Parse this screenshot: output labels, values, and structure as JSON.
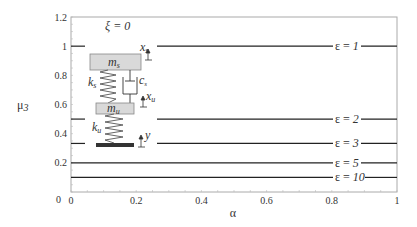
{
  "chart_data": {
    "type": "line",
    "title": "",
    "annotation": "ξ = 0",
    "xlabel": "α",
    "ylabel": "μ3",
    "xlim": [
      0,
      1
    ],
    "ylim": [
      0,
      1.2
    ],
    "x_ticks": [
      "0",
      "0.2",
      "0.4",
      "0.6",
      "0.8",
      "1"
    ],
    "y_ticks": [
      "0",
      "0.2",
      "0.4",
      "0.6",
      "0.8",
      "1",
      "1.2"
    ],
    "grid": false,
    "series": [
      {
        "name": "ε = 1",
        "x": [
          0,
          1
        ],
        "values": [
          1.0,
          1.0
        ]
      },
      {
        "name": "ε = 2",
        "x": [
          0,
          1
        ],
        "values": [
          0.5,
          0.5
        ]
      },
      {
        "name": "ε = 3",
        "x": [
          0,
          1
        ],
        "values": [
          0.333,
          0.333
        ]
      },
      {
        "name": "ε = 5",
        "x": [
          0,
          1
        ],
        "values": [
          0.2,
          0.2
        ]
      },
      {
        "name": "ε = 10",
        "x": [
          0,
          1
        ],
        "values": [
          0.1,
          0.1
        ]
      }
    ],
    "inset_diagram": {
      "description": "quarter-car model",
      "labels": {
        "sprung_mass": "m",
        "sprung_mass_sub": "s",
        "unsprung_mass": "m",
        "unsprung_mass_sub": "u",
        "spring_s": "k",
        "spring_s_sub": "s",
        "spring_u": "k",
        "spring_u_sub": "u",
        "damper": "c",
        "damper_sub": "s",
        "disp_s": "x",
        "disp_s_sub": "s",
        "disp_u": "x",
        "disp_u_sub": "u",
        "road": "y"
      }
    }
  },
  "labels": {
    "annotation": "ξ = 0",
    "xlabel": "α",
    "ylabel_main": "μ",
    "ylabel_sub": "3",
    "x_origin_extra": "0",
    "curve_prefix": "ε = ",
    "curves": [
      "1",
      "2",
      "3",
      "5",
      "10"
    ]
  },
  "colors": {
    "line": "#222222",
    "frame": "#aaaaaa",
    "mass_fill": "#d9d9d9",
    "ground": "#333333"
  }
}
